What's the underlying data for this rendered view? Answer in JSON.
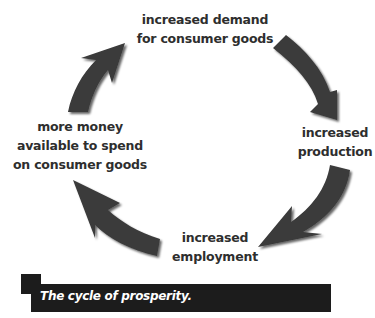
{
  "diagram": {
    "type": "cycle",
    "nodes": [
      {
        "id": "demand",
        "lines": [
          "increased demand",
          "for consumer goods"
        ]
      },
      {
        "id": "production",
        "lines": [
          "increased",
          "production"
        ]
      },
      {
        "id": "employment",
        "lines": [
          "increased",
          "employment"
        ]
      },
      {
        "id": "money",
        "lines": [
          "more money",
          "available to spend",
          "on consumer goods"
        ]
      }
    ],
    "edges": [
      {
        "from": "demand",
        "to": "production",
        "icon": "curved-arrow-icon"
      },
      {
        "from": "production",
        "to": "employment",
        "icon": "curved-arrow-icon"
      },
      {
        "from": "employment",
        "to": "money",
        "icon": "curved-arrow-icon"
      },
      {
        "from": "money",
        "to": "demand",
        "icon": "curved-arrow-icon"
      }
    ],
    "arrow_color": "#3a3a3a"
  },
  "caption": {
    "text": "The cycle of prosperity.",
    "background": "#1c1c1c",
    "color": "#ffffff"
  }
}
